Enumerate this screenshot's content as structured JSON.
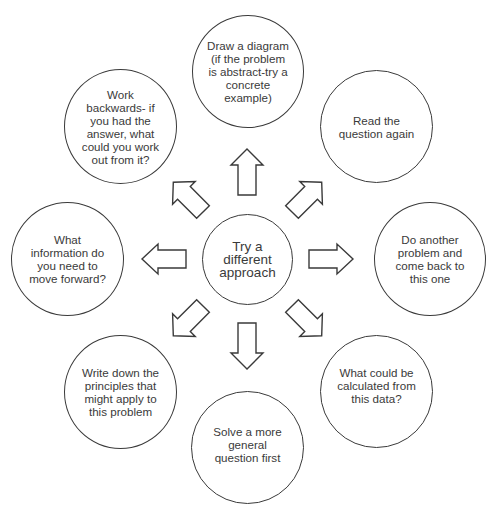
{
  "diagram": {
    "type": "radial-mind-map",
    "center": {
      "label": "Try a different approach",
      "lines": [
        "Try a",
        "different",
        "approach"
      ]
    },
    "nodes": [
      {
        "id": "top",
        "label": "Draw a diagram (if the problem is abstract-try a concrete example)",
        "lines": [
          "Draw a diagram",
          "(if the problem",
          "is abstract-try a",
          "concrete",
          "example)"
        ]
      },
      {
        "id": "top-right",
        "label": "Read the question again",
        "lines": [
          "Read the",
          "question again"
        ]
      },
      {
        "id": "right",
        "label": "Do another problem and come back to this one",
        "lines": [
          "Do another",
          "problem and",
          "come back to",
          "this one"
        ]
      },
      {
        "id": "bottom-right",
        "label": "What could be calculated from this data?",
        "lines": [
          "What could be",
          "calculated from",
          "this data?"
        ]
      },
      {
        "id": "bottom",
        "label": "Solve a more general question first",
        "lines": [
          "Solve a more",
          "general",
          "question first"
        ]
      },
      {
        "id": "bottom-left",
        "label": "Write down the principles that might apply to this problem",
        "lines": [
          "Write down the",
          "principles that",
          "might apply to",
          "this problem"
        ]
      },
      {
        "id": "left",
        "label": "What information do you need to move forward?",
        "lines": [
          "What",
          "information do",
          "you need to",
          "move forward?"
        ]
      },
      {
        "id": "top-left",
        "label": "Work backwards- if you had the answer, what could you work out from it?",
        "lines": [
          "Work",
          "backwards- if",
          "you had the",
          "answer, what",
          "could you work",
          "out from it?"
        ]
      }
    ],
    "edges": [
      {
        "from": "center",
        "to": "top",
        "style": "block-arrow-outline"
      },
      {
        "from": "center",
        "to": "top-right",
        "style": "block-arrow-outline"
      },
      {
        "from": "center",
        "to": "right",
        "style": "block-arrow-outline"
      },
      {
        "from": "center",
        "to": "bottom-right",
        "style": "block-arrow-outline"
      },
      {
        "from": "center",
        "to": "bottom",
        "style": "block-arrow-outline"
      },
      {
        "from": "center",
        "to": "bottom-left",
        "style": "block-arrow-outline"
      },
      {
        "from": "center",
        "to": "left",
        "style": "block-arrow-outline"
      },
      {
        "from": "center",
        "to": "top-left",
        "style": "block-arrow-outline"
      }
    ],
    "colors": {
      "stroke": "#3a3a3a",
      "fill": "#ffffff",
      "text": "#3a3a3a",
      "background": "#ffffff"
    }
  }
}
